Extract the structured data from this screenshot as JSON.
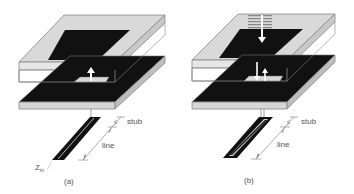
{
  "figure": {
    "panels": [
      {
        "id": "a",
        "caption": "(a)",
        "labels": {
          "stub": "stub",
          "line": "line",
          "zin": "Z",
          "zin_sub": "in"
        },
        "elements": [
          "superstrate-layer",
          "top-patch",
          "bottom-substrate",
          "ground-slot-aperture",
          "up-arrow",
          "microstrip-feed-line",
          "stub-dimension",
          "line-dimension",
          "input-impedance-label"
        ]
      },
      {
        "id": "b",
        "caption": "(b)",
        "labels": {
          "stub": "stub",
          "line": "line"
        },
        "elements": [
          "superstrate-layer",
          "top-patch",
          "incident-wave-hatching",
          "down-arrow-top",
          "bottom-substrate",
          "ground-slot-aperture",
          "down-arrow",
          "up-arrow",
          "microstrip-feed-line",
          "stub-dimension",
          "line-dimension"
        ]
      }
    ],
    "colors": {
      "patch": "#111111",
      "substrate_face": "#cfcfcf",
      "outline": "#777777",
      "label": "#555555",
      "slot": "#d8d8d8"
    }
  }
}
